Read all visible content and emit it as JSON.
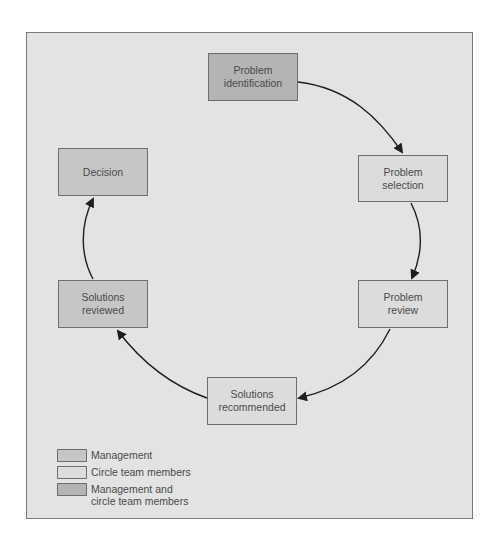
{
  "colors": {
    "panel_bg": "#e3e3e3",
    "management": "#c6c6c6",
    "circle_team": "#dcdcdc",
    "management_and_circle": "#b4b4b4",
    "arrow": "#1e1e1e"
  },
  "nodes": [
    {
      "id": "problem-identification",
      "label": "Problem\nidentification",
      "role": "management_and_circle"
    },
    {
      "id": "problem-selection",
      "label": "Problem\nselection",
      "role": "circle_team"
    },
    {
      "id": "problem-review",
      "label": "Problem\nreview",
      "role": "circle_team"
    },
    {
      "id": "solutions-recommended",
      "label": "Solutions\nrecommended",
      "role": "circle_team"
    },
    {
      "id": "solutions-reviewed",
      "label": "Solutions\nreviewed",
      "role": "management"
    },
    {
      "id": "decision",
      "label": "Decision",
      "role": "management"
    }
  ],
  "edges": [
    {
      "from": "problem-identification",
      "to": "problem-selection"
    },
    {
      "from": "problem-selection",
      "to": "problem-review"
    },
    {
      "from": "problem-review",
      "to": "solutions-recommended"
    },
    {
      "from": "solutions-recommended",
      "to": "solutions-reviewed"
    },
    {
      "from": "solutions-reviewed",
      "to": "decision"
    }
  ],
  "legend": [
    {
      "label": "Management",
      "role": "management"
    },
    {
      "label": "Circle team members",
      "role": "circle_team"
    },
    {
      "label": "Management and\ncircle team members",
      "role": "management_and_circle"
    }
  ]
}
